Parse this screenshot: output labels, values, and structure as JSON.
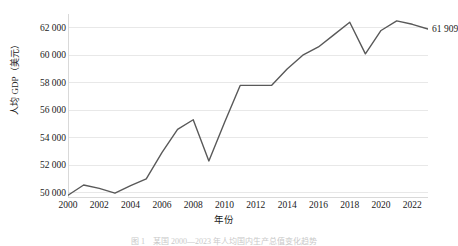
{
  "chart_data": {
    "type": "line",
    "title": "",
    "xlabel": "年份",
    "ylabel": "人均 GDP（美元）",
    "x": [
      2000,
      2001,
      2002,
      2003,
      2004,
      2005,
      2006,
      2007,
      2008,
      2009,
      2010,
      2011,
      2012,
      2013,
      2014,
      2015,
      2016,
      2017,
      2018,
      2019,
      2020,
      2021,
      2022,
      2023
    ],
    "values": [
      49800,
      50550,
      50300,
      49950,
      50500,
      51000,
      52900,
      54600,
      55300,
      52300,
      55100,
      57800,
      57800,
      57800,
      59000,
      60000,
      60600,
      61500,
      62400,
      60100,
      61800,
      62500,
      62250,
      61909
    ],
    "series": [
      {
        "name": "人均 GDP（美元）",
        "values": [
          49800,
          50550,
          50300,
          49950,
          50500,
          51000,
          52900,
          54600,
          55300,
          52300,
          55100,
          57800,
          57800,
          57800,
          59000,
          60000,
          60600,
          61500,
          62400,
          60100,
          61800,
          62500,
          62250,
          61909
        ]
      }
    ],
    "ylim": [
      49600,
      63000
    ],
    "xlim": [
      2000,
      2023
    ],
    "ytick_values": [
      50000,
      52000,
      54000,
      56000,
      58000,
      60000,
      62000
    ],
    "ytick_labels": [
      "50 000",
      "52 000",
      "54 000",
      "56 000",
      "58 000",
      "60 000",
      "62 000"
    ],
    "xtick_values": [
      2000,
      2002,
      2004,
      2006,
      2008,
      2010,
      2012,
      2014,
      2016,
      2018,
      2020,
      2022
    ],
    "xtick_labels": [
      "2000",
      "2002",
      "2004",
      "2006",
      "2008",
      "2010",
      "2012",
      "2014",
      "2016",
      "2018",
      "2020",
      "2022"
    ],
    "grid": "horizontal",
    "legend": "none",
    "line_color": "#595959",
    "gridline_color": "#e8e8e8",
    "axis_color": "#d9d9d9",
    "annotations": [
      {
        "name": "end-value",
        "text": "61 909",
        "x": 2023,
        "y": 61909
      }
    ]
  },
  "caption": {
    "text": "图 1　某国 2000—2023 年人均国内生产总值变化趋势"
  }
}
